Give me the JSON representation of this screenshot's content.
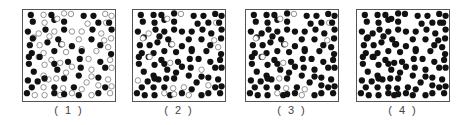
{
  "figure": {
    "colors": {
      "filled": "#111111",
      "hollow_stroke": "#777777",
      "border": "#555555"
    },
    "particle_radius": 3.2,
    "panels": [
      {
        "id": 1,
        "label": "( 1 )",
        "left": 16
      },
      {
        "id": 2,
        "label": "( 2 )",
        "left": 126
      },
      {
        "id": 3,
        "label": "( 3 )",
        "left": 239
      },
      {
        "id": 4,
        "label": "( 4 )",
        "left": 350
      }
    ],
    "positions": [
      [
        8,
        5
      ],
      [
        21,
        5
      ],
      [
        29,
        5
      ],
      [
        42,
        2
      ],
      [
        49,
        4
      ],
      [
        62,
        6
      ],
      [
        72,
        6
      ],
      [
        84,
        4
      ],
      [
        93,
        6
      ],
      [
        10,
        12
      ],
      [
        22,
        13
      ],
      [
        32,
        10
      ],
      [
        35,
        9
      ],
      [
        42,
        12
      ],
      [
        66,
        14
      ],
      [
        77,
        13
      ],
      [
        85,
        13
      ],
      [
        88,
        13
      ],
      [
        5,
        22
      ],
      [
        16,
        24
      ],
      [
        23,
        20
      ],
      [
        32,
        22
      ],
      [
        42,
        20
      ],
      [
        50,
        22
      ],
      [
        60,
        22
      ],
      [
        71,
        20
      ],
      [
        80,
        24
      ],
      [
        91,
        20
      ],
      [
        11,
        28
      ],
      [
        10,
        29
      ],
      [
        27,
        27
      ],
      [
        36,
        30
      ],
      [
        57,
        30
      ],
      [
        70,
        30
      ],
      [
        83,
        31
      ],
      [
        90,
        29
      ],
      [
        7,
        36
      ],
      [
        17,
        36
      ],
      [
        25,
        33
      ],
      [
        39,
        35
      ],
      [
        40,
        35
      ],
      [
        50,
        37
      ],
      [
        60,
        40
      ],
      [
        79,
        36
      ],
      [
        87,
        38
      ],
      [
        9,
        44
      ],
      [
        21,
        44
      ],
      [
        32,
        42
      ],
      [
        44,
        43
      ],
      [
        60,
        42
      ],
      [
        75,
        42
      ],
      [
        90,
        45
      ],
      [
        6,
        48
      ],
      [
        16,
        48
      ],
      [
        17,
        48
      ],
      [
        29,
        51
      ],
      [
        58,
        50
      ],
      [
        67,
        50
      ],
      [
        79,
        53
      ],
      [
        89,
        51
      ],
      [
        6,
        55
      ],
      [
        22,
        56
      ],
      [
        32,
        55
      ],
      [
        38,
        54
      ],
      [
        46,
        53
      ],
      [
        50,
        58
      ],
      [
        59,
        59
      ],
      [
        70,
        61
      ],
      [
        84,
        59
      ],
      [
        92,
        59
      ],
      [
        11,
        63
      ],
      [
        21,
        67
      ],
      [
        35,
        61
      ],
      [
        44,
        64
      ],
      [
        57,
        67
      ],
      [
        65,
        74
      ],
      [
        77,
        69
      ],
      [
        87,
        71
      ],
      [
        5,
        72
      ],
      [
        15,
        73
      ],
      [
        26,
        71
      ],
      [
        22,
        70
      ],
      [
        34,
        70
      ],
      [
        42,
        70
      ],
      [
        70,
        68
      ],
      [
        52,
        79
      ],
      [
        60,
        81
      ],
      [
        77,
        77
      ],
      [
        84,
        79
      ],
      [
        94,
        78
      ],
      [
        9,
        79
      ],
      [
        21,
        79
      ],
      [
        32,
        79
      ],
      [
        41,
        80
      ],
      [
        4,
        85
      ],
      [
        12,
        87
      ],
      [
        22,
        87
      ],
      [
        32,
        85
      ],
      [
        38,
        87
      ],
      [
        42,
        86
      ],
      [
        50,
        85
      ],
      [
        57,
        87
      ],
      [
        70,
        87
      ],
      [
        77,
        85
      ],
      [
        89,
        85
      ]
    ],
    "hollow_indices": {
      "1": [
        1,
        3,
        4,
        7,
        8,
        10,
        12,
        14,
        16,
        19,
        21,
        23,
        24,
        26,
        28,
        30,
        32,
        34,
        35,
        37,
        40,
        42,
        44,
        46,
        48,
        50,
        53,
        55,
        57,
        59,
        61,
        63,
        65,
        67,
        69,
        71,
        73,
        75,
        77,
        80,
        82,
        84,
        86,
        87,
        89,
        91,
        93,
        95,
        96,
        98,
        100,
        102,
        104
      ],
      "2": [
        4,
        12,
        16,
        19,
        29,
        34,
        40,
        44,
        54,
        63,
        67,
        78,
        85,
        87,
        93,
        97,
        99,
        101
      ],
      "3": [
        4,
        12,
        16,
        29,
        34,
        40,
        54,
        63,
        82,
        86,
        93,
        97,
        101
      ],
      "4": []
    }
  }
}
